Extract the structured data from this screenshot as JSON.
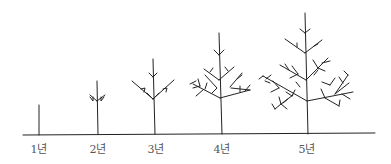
{
  "diagram": {
    "line_color": "#222222",
    "stages": [
      {
        "label": "1년",
        "x": 39
      },
      {
        "label": "2년",
        "x": 98
      },
      {
        "label": "3년",
        "x": 155
      },
      {
        "label": "4년",
        "x": 222
      },
      {
        "label": "5년",
        "x": 307
      }
    ]
  }
}
